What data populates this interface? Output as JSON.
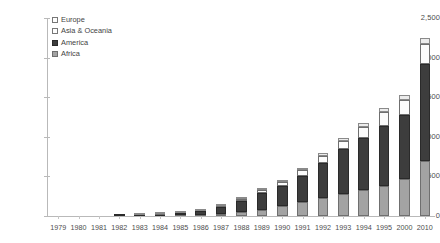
{
  "chart_data": {
    "type": "bar",
    "stacked": true,
    "title": "",
    "subtitle": "",
    "xlabel": "",
    "ylabel": "",
    "grid": false,
    "legend_position": "top-left",
    "ylim": [
      0,
      2500
    ],
    "ytick_labels": [
      "2,500",
      "2,000",
      "1,500",
      "1,000",
      "500",
      "0"
    ],
    "ytick_values": [
      2500,
      2000,
      1500,
      1000,
      500,
      0
    ],
    "categories": [
      "1979",
      "1980",
      "1981",
      "1982",
      "1983",
      "1984",
      "1985",
      "1986",
      "1987",
      "1988",
      "1989",
      "1990",
      "1991",
      "1992",
      "1993",
      "1994",
      "1995",
      "2000",
      "2010"
    ],
    "series": [
      {
        "name": "Africa",
        "swatch": "#a3a3a3",
        "values": [
          0,
          0,
          0,
          0,
          3,
          5,
          8,
          14,
          25,
          45,
          80,
          130,
          180,
          230,
          280,
          330,
          380,
          470,
          700
        ]
      },
      {
        "name": "America",
        "swatch": "#3d3d3d",
        "values": [
          0,
          0,
          0,
          2,
          7,
          12,
          24,
          46,
          85,
          150,
          210,
          250,
          330,
          440,
          560,
          650,
          760,
          800,
          1220
        ]
      },
      {
        "name": "Asia & Oceania",
        "swatch": "#fbfbfb",
        "values": [
          0,
          0,
          0,
          0,
          2,
          3,
          4,
          8,
          12,
          20,
          35,
          55,
          70,
          90,
          110,
          140,
          170,
          190,
          250
        ]
      },
      {
        "name": "Europe",
        "swatch": "#ececec",
        "values": [
          0,
          0,
          0,
          0,
          1,
          1,
          2,
          3,
          5,
          8,
          12,
          18,
          25,
          30,
          40,
          50,
          60,
          70,
          80
        ]
      }
    ],
    "totals": [
      0,
      0,
      0,
      2,
      13,
      21,
      38,
      71,
      127,
      223,
      337,
      453,
      605,
      790,
      990,
      1170,
      1370,
      1530,
      2250
    ]
  },
  "legend": {
    "items": [
      {
        "label": "Europe"
      },
      {
        "label": "Asia & Oceania"
      },
      {
        "label": "America"
      },
      {
        "label": "Africa"
      }
    ]
  }
}
